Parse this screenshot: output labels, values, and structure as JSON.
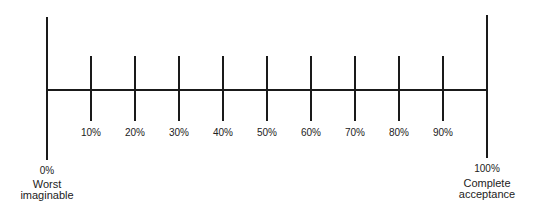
{
  "scale": {
    "end_left": {
      "percent": "0%",
      "caption_line1": "Worst",
      "caption_line2": "imaginable"
    },
    "end_right": {
      "percent": "100%",
      "caption_line1": "Complete",
      "caption_line2": "acceptance"
    },
    "ticks": [
      "10%",
      "20%",
      "30%",
      "40%",
      "50%",
      "60%",
      "70%",
      "80%",
      "90%"
    ]
  },
  "colors": {
    "line": "#1a1a1a",
    "text": "#222222",
    "background": "#ffffff"
  }
}
